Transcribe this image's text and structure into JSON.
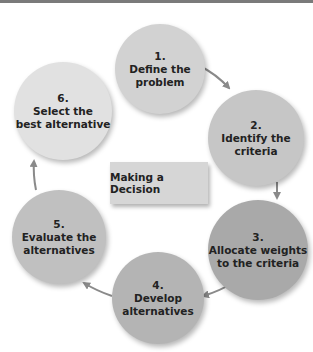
{
  "title": "Making a Decision",
  "colors": {
    "top_bar": "#7a7a7a",
    "arrow": "#8a8a8a",
    "step1": "#d2d2d2",
    "step2": "#c6c6c6",
    "step3": "#a9a9a9",
    "step4": "#b4b4b4",
    "step5": "#c0c0c0",
    "step6": "#e1e1e1",
    "center_box": "#d6d6d6"
  },
  "steps": [
    {
      "number": "1.",
      "line1": "Define the",
      "line2": "problem"
    },
    {
      "number": "2.",
      "line1": "Identify the",
      "line2": "criteria"
    },
    {
      "number": "3.",
      "line1": "Allocate weights",
      "line2": "to the criteria"
    },
    {
      "number": "4.",
      "line1": "Develop",
      "line2": "alternatives"
    },
    {
      "number": "5.",
      "line1": "Evaluate the",
      "line2": "alternatives"
    },
    {
      "number": "6.",
      "line1": "Select the",
      "line2": "best alternative"
    }
  ],
  "arrows": [
    {
      "from": "1",
      "to": "2",
      "icon": "arrow-right-down"
    },
    {
      "from": "2",
      "to": "3",
      "icon": "arrow-down"
    },
    {
      "from": "3",
      "to": "4",
      "icon": "arrow-down-left"
    },
    {
      "from": "4",
      "to": "5",
      "icon": "arrow-up-left"
    },
    {
      "from": "5",
      "to": "6",
      "icon": "arrow-up"
    }
  ]
}
